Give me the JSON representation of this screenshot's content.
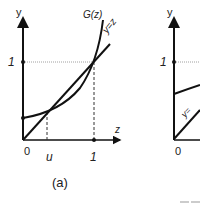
{
  "panels": [
    {
      "id": "a",
      "caption": "(a)",
      "y_axis_label": "y",
      "x_axis_label": "z",
      "y_tick_label": "1",
      "origin_label": "0",
      "x_ticks": [
        "u",
        "1"
      ],
      "curve_label": "G(z)",
      "line_label": "y=z"
    },
    {
      "id": "b",
      "y_axis_label": "y",
      "y_tick_label": "1",
      "origin_label": "0",
      "line_label": "y="
    }
  ],
  "colors": {
    "stroke": "#111111",
    "guide": "#888888"
  }
}
